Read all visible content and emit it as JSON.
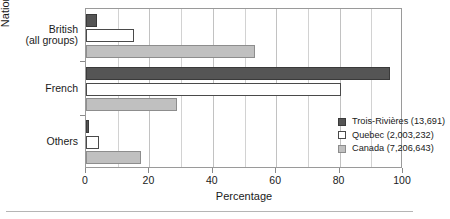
{
  "chart_data": {
    "type": "bar",
    "orientation": "horizontal",
    "title": "",
    "xlabel": "Percentage",
    "ylabel": "National origin",
    "categories": [
      "British\n(all groups)",
      "French",
      "Others"
    ],
    "category_lines": [
      [
        "British",
        "(all groups)"
      ],
      [
        "French"
      ],
      [
        "Others"
      ]
    ],
    "series": [
      {
        "name": "Trois-Rivières (13,691)",
        "color": "#555555",
        "values": [
          3.5,
          95.9,
          0.8
        ]
      },
      {
        "name": "Quebec (2,003,232)",
        "color": "#ffffff",
        "values": [
          15.0,
          80.4,
          4.2
        ]
      },
      {
        "name": "Canada (7,206,643)",
        "color": "#c0c0c0",
        "values": [
          53.3,
          28.6,
          17.5
        ]
      }
    ],
    "xlim": [
      0,
      100
    ],
    "xticks": [
      0,
      20,
      40,
      60,
      80,
      100
    ],
    "xtick_labels": [
      "0",
      "20",
      "40",
      "60",
      "80",
      "100"
    ],
    "gridline_step": 10,
    "grid": true,
    "legend_position": "inside-bottom-right"
  },
  "axes": {
    "x_title": "Percentage",
    "y_title": "National origin"
  },
  "legend": {
    "entries": [
      {
        "label": "Trois-Rivières (13,691)",
        "swatch": "dark-gray-swatch"
      },
      {
        "label": "Quebec (2,003,232)",
        "swatch": "white-swatch"
      },
      {
        "label": "Canada (7,206,643)",
        "swatch": "light-gray-swatch"
      }
    ]
  }
}
